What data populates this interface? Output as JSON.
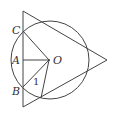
{
  "diagram": {
    "type": "geometry",
    "colors": {
      "stroke": "#444444",
      "text": "#333333",
      "background": "#ffffff"
    },
    "circle": {
      "center_label": "O",
      "cx": 50,
      "cy": 60,
      "r": 39
    },
    "triangle": {
      "vertices": [
        [
          23,
          11
        ],
        [
          107,
          60
        ],
        [
          23,
          107
        ]
      ]
    },
    "points": {
      "C": {
        "label": "C",
        "x": 23,
        "y": 31
      },
      "A": {
        "label": "A",
        "x": 23,
        "y": 60
      },
      "B": {
        "label": "B",
        "x": 23,
        "y": 87
      },
      "O": {
        "label": "O",
        "x": 49,
        "y": 60
      },
      "D": {
        "label": "",
        "x": 41,
        "y": 98
      }
    },
    "angle_labels": [
      {
        "label": "1",
        "x": 34,
        "y": 85
      }
    ]
  }
}
